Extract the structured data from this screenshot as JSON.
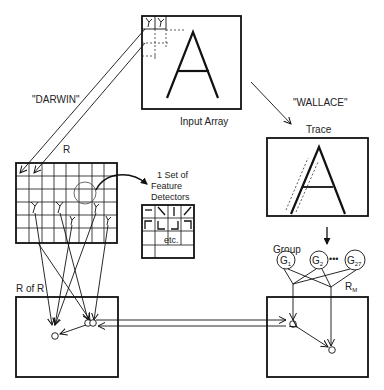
{
  "diagram": {
    "labels": {
      "input_array": "Input Array",
      "darwin": "\"DARWIN\"",
      "wallace": "\"WALLACE\"",
      "trace": "Trace",
      "r": "R",
      "r_of_r": "R of R",
      "r_m": "R",
      "r_m_sub": "M",
      "feature_line1": "1 Set of",
      "feature_line2": "Feature",
      "feature_line3": "Detectors",
      "etc": "etc.",
      "group": "Group",
      "input_letter": "A",
      "trace_letter": "A"
    },
    "groups": [
      {
        "label": "G",
        "sub": "1"
      },
      {
        "label": "G",
        "sub": "2"
      },
      {
        "label": "G",
        "sub": "27"
      }
    ],
    "ellipsis": "•••",
    "colors": {
      "ink": "#111111",
      "background": "#ffffff"
    }
  }
}
